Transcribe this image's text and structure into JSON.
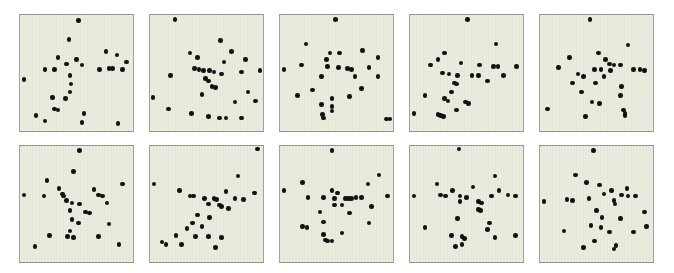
{
  "figure": {
    "title": "",
    "background_color": "#ffffff",
    "panel_background_color": "#e9e9db",
    "panel_border_color": "#8e8e86",
    "marker_color": "#121212",
    "marker_shape": "circle",
    "grid_rows": 2,
    "grid_columns": 5,
    "panel_count": 10
  },
  "chart_data": {
    "type": "scatter",
    "title": "",
    "subtitle": "",
    "xlabel": "",
    "ylabel": "",
    "xlim": [
      0,
      100
    ],
    "ylim": [
      0,
      100
    ],
    "grid": false,
    "legend": null,
    "layout": {
      "rows": 2,
      "cols": 5,
      "panel_width_px": 115,
      "panel_height_px": 118,
      "col_x_px": [
        19,
        149,
        279,
        409,
        539
      ],
      "row_y_px": [
        14,
        145
      ]
    },
    "panels": [
      {
        "name": "panel-1",
        "row": 0,
        "col": 0,
        "n_points": 28,
        "points": [
          [
            52,
            97
          ],
          [
            43,
            80
          ],
          [
            77,
            69
          ],
          [
            87,
            66
          ],
          [
            33,
            64
          ],
          [
            96,
            60
          ],
          [
            50,
            62
          ],
          [
            41,
            58
          ],
          [
            55,
            57
          ],
          [
            21,
            53
          ],
          [
            30,
            53
          ],
          [
            71,
            53
          ],
          [
            80,
            54
          ],
          [
            83,
            54
          ],
          [
            92,
            53
          ],
          [
            44,
            48
          ],
          [
            2,
            44
          ],
          [
            45,
            40
          ],
          [
            44,
            33
          ],
          [
            28,
            28
          ],
          [
            40,
            27
          ],
          [
            30,
            18
          ],
          [
            33,
            17
          ],
          [
            57,
            14
          ],
          [
            13,
            12
          ],
          [
            21,
            7
          ],
          [
            55,
            6
          ],
          [
            88,
            5
          ]
        ]
      },
      {
        "name": "panel-2",
        "row": 0,
        "col": 1,
        "n_points": 30,
        "points": [
          [
            21,
            98
          ],
          [
            63,
            79
          ],
          [
            35,
            68
          ],
          [
            73,
            69
          ],
          [
            42,
            64
          ],
          [
            66,
            60
          ],
          [
            86,
            62
          ],
          [
            39,
            54
          ],
          [
            43,
            53
          ],
          [
            47,
            52
          ],
          [
            53,
            52
          ],
          [
            57,
            51
          ],
          [
            64,
            49
          ],
          [
            82,
            51
          ],
          [
            99,
            52
          ],
          [
            17,
            48
          ],
          [
            49,
            45
          ],
          [
            52,
            43
          ],
          [
            55,
            38
          ],
          [
            58,
            37
          ],
          [
            46,
            31
          ],
          [
            88,
            33
          ],
          [
            1,
            28
          ],
          [
            76,
            24
          ],
          [
            95,
            25
          ],
          [
            15,
            18
          ],
          [
            36,
            14
          ],
          [
            52,
            11
          ],
          [
            62,
            10
          ],
          [
            68,
            10
          ],
          [
            82,
            10
          ]
        ]
      },
      {
        "name": "panel-3",
        "row": 0,
        "col": 2,
        "n_points": 29,
        "points": [
          [
            49,
            98
          ],
          [
            22,
            76
          ],
          [
            44,
            68
          ],
          [
            53,
            68
          ],
          [
            74,
            70
          ],
          [
            41,
            62
          ],
          [
            88,
            64
          ],
          [
            18,
            57
          ],
          [
            42,
            56
          ],
          [
            52,
            55
          ],
          [
            60,
            54
          ],
          [
            64,
            53
          ],
          [
            80,
            55
          ],
          [
            2,
            53
          ],
          [
            36,
            47
          ],
          [
            67,
            47
          ],
          [
            88,
            47
          ],
          [
            73,
            36
          ],
          [
            28,
            35
          ],
          [
            14,
            30
          ],
          [
            46,
            27
          ],
          [
            62,
            29
          ],
          [
            36,
            22
          ],
          [
            46,
            20
          ],
          [
            37,
            13
          ],
          [
            38,
            10
          ],
          [
            96,
            9
          ],
          [
            99,
            9
          ],
          [
            46,
            16
          ]
        ]
      },
      {
        "name": "panel-4",
        "row": 0,
        "col": 3,
        "n_points": 30,
        "points": [
          [
            51,
            98
          ],
          [
            77,
            76
          ],
          [
            30,
            68
          ],
          [
            24,
            62
          ],
          [
            17,
            57
          ],
          [
            45,
            59
          ],
          [
            62,
            57
          ],
          [
            75,
            56
          ],
          [
            79,
            56
          ],
          [
            96,
            56
          ],
          [
            28,
            50
          ],
          [
            34,
            49
          ],
          [
            42,
            48
          ],
          [
            55,
            48
          ],
          [
            61,
            48
          ],
          [
            84,
            48
          ],
          [
            39,
            41
          ],
          [
            41,
            40
          ],
          [
            69,
            43
          ],
          [
            36,
            33
          ],
          [
            12,
            30
          ],
          [
            30,
            27
          ],
          [
            33,
            25
          ],
          [
            49,
            24
          ],
          [
            52,
            23
          ],
          [
            2,
            14
          ],
          [
            24,
            13
          ],
          [
            26,
            12
          ],
          [
            29,
            11
          ],
          [
            41,
            17
          ]
        ]
      },
      {
        "name": "panel-5",
        "row": 0,
        "col": 4,
        "n_points": 30,
        "points": [
          [
            44,
            98
          ],
          [
            79,
            75
          ],
          [
            52,
            68
          ],
          [
            25,
            64
          ],
          [
            58,
            62
          ],
          [
            62,
            58
          ],
          [
            66,
            57
          ],
          [
            72,
            57
          ],
          [
            15,
            55
          ],
          [
            48,
            53
          ],
          [
            54,
            53
          ],
          [
            63,
            52
          ],
          [
            84,
            53
          ],
          [
            90,
            53
          ],
          [
            94,
            52
          ],
          [
            33,
            49
          ],
          [
            38,
            47
          ],
          [
            57,
            47
          ],
          [
            28,
            41
          ],
          [
            49,
            41
          ],
          [
            73,
            38
          ],
          [
            36,
            33
          ],
          [
            72,
            30
          ],
          [
            46,
            24
          ],
          [
            53,
            23
          ],
          [
            5,
            18
          ],
          [
            75,
            17
          ],
          [
            76,
            12
          ],
          [
            40,
            11
          ],
          [
            76,
            14
          ]
        ]
      },
      {
        "name": "panel-6",
        "row": 1,
        "col": 0,
        "n_points": 29,
        "points": [
          [
            53,
            98
          ],
          [
            47,
            79
          ],
          [
            23,
            71
          ],
          [
            92,
            68
          ],
          [
            34,
            64
          ],
          [
            66,
            63
          ],
          [
            37,
            59
          ],
          [
            38,
            57
          ],
          [
            70,
            58
          ],
          [
            74,
            57
          ],
          [
            2,
            58
          ],
          [
            20,
            57
          ],
          [
            41,
            53
          ],
          [
            46,
            51
          ],
          [
            53,
            50
          ],
          [
            78,
            51
          ],
          [
            44,
            44
          ],
          [
            58,
            43
          ],
          [
            62,
            42
          ],
          [
            46,
            36
          ],
          [
            52,
            33
          ],
          [
            80,
            32
          ],
          [
            44,
            26
          ],
          [
            25,
            22
          ],
          [
            42,
            21
          ],
          [
            47,
            20
          ],
          [
            70,
            21
          ],
          [
            12,
            12
          ],
          [
            89,
            14
          ]
        ]
      },
      {
        "name": "panel-7",
        "row": 1,
        "col": 1,
        "n_points": 30,
        "points": [
          [
            97,
            99
          ],
          [
            79,
            75
          ],
          [
            2,
            68
          ],
          [
            25,
            62
          ],
          [
            68,
            61
          ],
          [
            94,
            60
          ],
          [
            35,
            57
          ],
          [
            38,
            57
          ],
          [
            48,
            55
          ],
          [
            57,
            55
          ],
          [
            59,
            54
          ],
          [
            76,
            55
          ],
          [
            84,
            54
          ],
          [
            52,
            50
          ],
          [
            62,
            49
          ],
          [
            64,
            48
          ],
          [
            70,
            46
          ],
          [
            42,
            40
          ],
          [
            53,
            38
          ],
          [
            37,
            33
          ],
          [
            46,
            30
          ],
          [
            32,
            28
          ],
          [
            22,
            22
          ],
          [
            40,
            21
          ],
          [
            52,
            21
          ],
          [
            9,
            16
          ],
          [
            13,
            14
          ],
          [
            27,
            14
          ],
          [
            58,
            11
          ],
          [
            64,
            20
          ]
        ]
      },
      {
        "name": "panel-8",
        "row": 1,
        "col": 2,
        "n_points": 30,
        "points": [
          [
            46,
            98
          ],
          [
            89,
            76
          ],
          [
            19,
            69
          ],
          [
            79,
            68
          ],
          [
            2,
            62
          ],
          [
            46,
            62
          ],
          [
            51,
            60
          ],
          [
            24,
            56
          ],
          [
            38,
            56
          ],
          [
            48,
            55
          ],
          [
            58,
            55
          ],
          [
            61,
            55
          ],
          [
            64,
            55
          ],
          [
            68,
            56
          ],
          [
            73,
            56
          ],
          [
            97,
            57
          ],
          [
            48,
            49
          ],
          [
            55,
            49
          ],
          [
            82,
            48
          ],
          [
            35,
            43
          ],
          [
            62,
            42
          ],
          [
            38,
            34
          ],
          [
            80,
            33
          ],
          [
            19,
            30
          ],
          [
            23,
            29
          ],
          [
            38,
            23
          ],
          [
            55,
            24
          ],
          [
            40,
            18
          ],
          [
            42,
            17
          ],
          [
            46,
            17
          ]
        ]
      },
      {
        "name": "panel-9",
        "row": 1,
        "col": 3,
        "n_points": 30,
        "points": [
          [
            43,
            99
          ],
          [
            76,
            75
          ],
          [
            23,
            68
          ],
          [
            56,
            65
          ],
          [
            37,
            62
          ],
          [
            80,
            62
          ],
          [
            26,
            58
          ],
          [
            31,
            57
          ],
          [
            44,
            57
          ],
          [
            50,
            56
          ],
          [
            73,
            57
          ],
          [
            88,
            58
          ],
          [
            95,
            57
          ],
          [
            2,
            57
          ],
          [
            44,
            52
          ],
          [
            61,
            52
          ],
          [
            64,
            51
          ],
          [
            61,
            45
          ],
          [
            63,
            44
          ],
          [
            42,
            37
          ],
          [
            71,
            33
          ],
          [
            69,
            27
          ],
          [
            12,
            29
          ],
          [
            36,
            22
          ],
          [
            46,
            21
          ],
          [
            48,
            19
          ],
          [
            76,
            20
          ],
          [
            95,
            22
          ],
          [
            40,
            12
          ],
          [
            46,
            14
          ]
        ]
      },
      {
        "name": "panel-10",
        "row": 1,
        "col": 4,
        "n_points": 30,
        "points": [
          [
            47,
            98
          ],
          [
            31,
            76
          ],
          [
            41,
            69
          ],
          [
            53,
            67
          ],
          [
            64,
            62
          ],
          [
            78,
            64
          ],
          [
            57,
            59
          ],
          [
            73,
            58
          ],
          [
            79,
            57
          ],
          [
            86,
            57
          ],
          [
            23,
            54
          ],
          [
            28,
            53
          ],
          [
            43,
            55
          ],
          [
            66,
            53
          ],
          [
            67,
            50
          ],
          [
            2,
            52
          ],
          [
            50,
            44
          ],
          [
            94,
            43
          ],
          [
            55,
            38
          ],
          [
            72,
            37
          ],
          [
            45,
            31
          ],
          [
            54,
            29
          ],
          [
            96,
            30
          ],
          [
            20,
            26
          ],
          [
            62,
            25
          ],
          [
            84,
            25
          ],
          [
            48,
            17
          ],
          [
            68,
            13
          ],
          [
            66,
            10
          ],
          [
            38,
            11
          ]
        ]
      }
    ]
  }
}
